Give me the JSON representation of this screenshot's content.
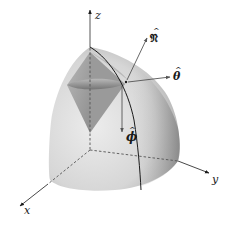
{
  "figure": {
    "axes": {
      "x": {
        "label": "x"
      },
      "y": {
        "label": "y"
      },
      "z": {
        "label": "z"
      }
    },
    "vectors": [
      {
        "name": "normal",
        "label": "𝔑",
        "hat": "^"
      },
      {
        "name": "theta",
        "label": "θ",
        "hat": "^"
      },
      {
        "name": "phi",
        "label": "ϕ",
        "hat": "^"
      }
    ],
    "colors": {
      "surface_light": "#e6e6e6",
      "surface_mid": "#c8c8c8",
      "surface_dark": "#8a8a8a",
      "cone_dark": "#7a7a7a",
      "cone_mid": "#a8a8a8",
      "line": "#1a1a1a",
      "background": "#ffffff"
    }
  }
}
